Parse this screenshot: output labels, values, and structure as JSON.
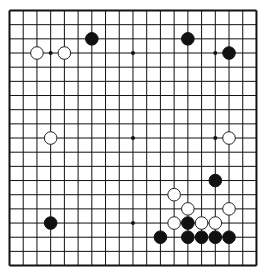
{
  "board": {
    "size": 19,
    "origin": {
      "x": 9.5,
      "y": 10.5
    },
    "spacing": {
      "x": 13.72,
      "y": 14.17
    },
    "line_color": "#111111",
    "background": "#ffffff",
    "star_points": [
      [
        3,
        3
      ],
      [
        9,
        3
      ],
      [
        15,
        3
      ],
      [
        3,
        9
      ],
      [
        9,
        9
      ],
      [
        15,
        9
      ],
      [
        3,
        15
      ],
      [
        9,
        15
      ],
      [
        15,
        15
      ]
    ],
    "stones": [
      {
        "color": "black",
        "col": 6,
        "row": 2
      },
      {
        "color": "black",
        "col": 13,
        "row": 2
      },
      {
        "color": "white",
        "col": 2,
        "row": 3
      },
      {
        "color": "white",
        "col": 4,
        "row": 3
      },
      {
        "color": "black",
        "col": 16,
        "row": 3
      },
      {
        "color": "white",
        "col": 3,
        "row": 9
      },
      {
        "color": "white",
        "col": 16,
        "row": 9
      },
      {
        "color": "black",
        "col": 15,
        "row": 12
      },
      {
        "color": "white",
        "col": 12,
        "row": 13
      },
      {
        "color": "white",
        "col": 13,
        "row": 14
      },
      {
        "color": "white",
        "col": 16,
        "row": 14
      },
      {
        "color": "black",
        "col": 3,
        "row": 15
      },
      {
        "color": "white",
        "col": 12,
        "row": 15
      },
      {
        "color": "black",
        "col": 13,
        "row": 15
      },
      {
        "color": "white",
        "col": 14,
        "row": 15
      },
      {
        "color": "white",
        "col": 15,
        "row": 15
      },
      {
        "color": "black",
        "col": 11,
        "row": 16
      },
      {
        "color": "black",
        "col": 13,
        "row": 16
      },
      {
        "color": "black",
        "col": 14,
        "row": 16
      },
      {
        "color": "black",
        "col": 15,
        "row": 16
      },
      {
        "color": "black",
        "col": 16,
        "row": 16
      }
    ]
  }
}
